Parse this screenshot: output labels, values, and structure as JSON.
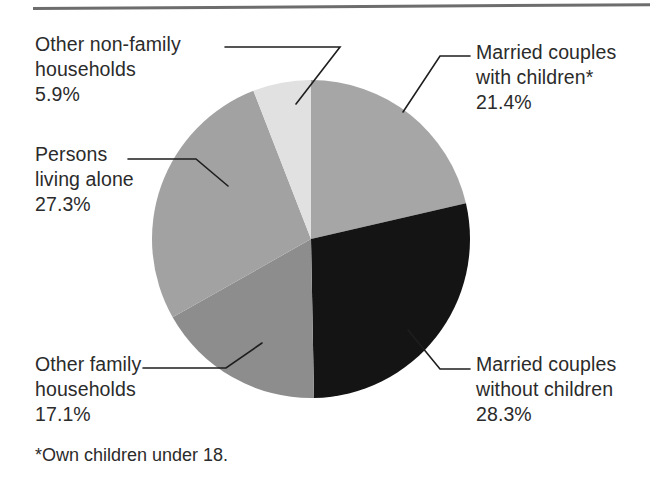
{
  "chart_data": {
    "type": "pie",
    "title": "",
    "subtitle": "",
    "xlabel": "",
    "ylabel": "",
    "legend_position": "callout-labels",
    "grid": false,
    "units": "percent",
    "total": 100.0,
    "categories": [
      "Married couples with children*",
      "Married couples without children",
      "Other family households",
      "Persons living alone",
      "Other non-family households"
    ],
    "values": [
      21.4,
      28.3,
      17.1,
      27.3,
      5.9
    ],
    "slices": [
      {
        "id": "married-with-children",
        "label_lines": [
          "Married couples",
          "with children*"
        ],
        "value_text": "21.4%",
        "value": 21.4,
        "color": "#a6a6a6",
        "start_angle_deg": 0.0,
        "end_angle_deg": 77.04
      },
      {
        "id": "married-without-children",
        "label_lines": [
          "Married couples",
          "without children"
        ],
        "value_text": "28.3%",
        "value": 28.3,
        "color": "#141414",
        "start_angle_deg": 77.04,
        "end_angle_deg": 178.92
      },
      {
        "id": "other-family-households",
        "label_lines": [
          "Other family",
          "households"
        ],
        "value_text": "17.1%",
        "value": 17.1,
        "color": "#8d8d8d",
        "start_angle_deg": 178.92,
        "end_angle_deg": 240.48
      },
      {
        "id": "persons-living-alone",
        "label_lines": [
          "Persons",
          "living alone"
        ],
        "value_text": "27.3%",
        "value": 27.3,
        "color": "#a2a2a2",
        "start_angle_deg": 240.48,
        "end_angle_deg": 338.76
      },
      {
        "id": "other-non-family-households",
        "label_lines": [
          "Other non-family",
          "households"
        ],
        "value_text": "5.9%",
        "value": 5.9,
        "color": "#e1e1e1",
        "start_angle_deg": 338.76,
        "end_angle_deg": 360.0
      }
    ]
  },
  "labels": {
    "other_nonfamily": {
      "line1": "Other non-family",
      "line2": "households",
      "value": "5.9%"
    },
    "persons_alone": {
      "line1": "Persons",
      "line2": "living alone",
      "value": "27.3%"
    },
    "other_family": {
      "line1": "Other family",
      "line2": "households",
      "value": "17.1%"
    },
    "married_with": {
      "line1": "Married couples",
      "line2": "with children*",
      "value": "21.4%"
    },
    "married_without": {
      "line1": "Married couples",
      "line2": "without children",
      "value": "28.3%"
    }
  },
  "footnote": "*Own children under 18.",
  "colors": {
    "rule": "#6d6d6d",
    "text": "#2b2b2b",
    "leader_line": "#1e1e1e",
    "background": "#ffffff"
  }
}
